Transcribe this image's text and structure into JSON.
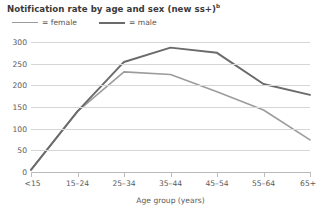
{
  "chart_data": {
    "type": "line",
    "title": "Notification rate by age and sex (new ss+)",
    "title_superscript": "b",
    "xlabel": "Age group (years)",
    "ylabel": "",
    "categories": [
      "<15",
      "15–24",
      "25–34",
      "35–44",
      "45–54",
      "55–64",
      "65+"
    ],
    "series": [
      {
        "name": "female",
        "color": "#9c9c9c",
        "values": [
          5,
          140,
          231,
          225,
          185,
          143,
          74
        ]
      },
      {
        "name": "male",
        "color": "#6b6b6b",
        "values": [
          5,
          140,
          254,
          287,
          275,
          203,
          178
        ]
      }
    ],
    "ylim": [
      0,
      300
    ],
    "yticks": [
      0,
      50,
      100,
      150,
      200,
      250,
      300
    ],
    "grid": true,
    "legend_position": "top-left"
  },
  "legend": {
    "female_label": "= female",
    "male_label": "= male"
  }
}
